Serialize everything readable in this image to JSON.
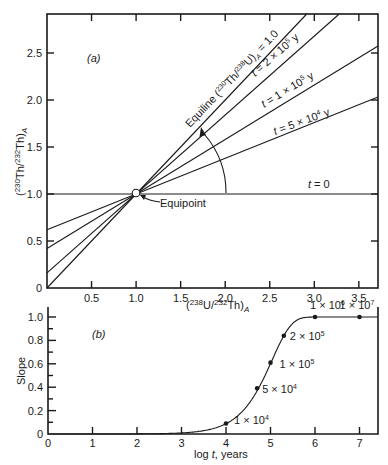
{
  "chart_data": [
    {
      "id": "a",
      "type": "line",
      "panel_label": "(a)",
      "xlabel": "(238U/232Th)A",
      "ylabel": "(230Th/232Th)A",
      "xlim": [
        0,
        3.71
      ],
      "ylim": [
        0,
        2.91
      ],
      "x_ticks": [
        0.5,
        1.0,
        1.5,
        2.0,
        2.5,
        3.0,
        3.5
      ],
      "x_tick_labels": [
        "0.5",
        "1.0",
        "1.5",
        "2.0",
        "2.5",
        "3.0",
        "3.5"
      ],
      "y_ticks": [
        0,
        0.5,
        1.0,
        1.5,
        2.0,
        2.5
      ],
      "y_tick_labels": [
        "0",
        "0.5",
        "1.0",
        "1.5",
        "2.0",
        "2.5"
      ],
      "equipoint": {
        "x": 1.0,
        "y": 1.0,
        "label": "Equipoint"
      },
      "series": [
        {
          "name": "t = 0",
          "slope": 0.0,
          "intercept": 1.0
        },
        {
          "name": "t = 5 × 10⁴ y",
          "slope": 0.38,
          "intercept": 0.62
        },
        {
          "name": "t = 1 × 10⁵ y",
          "slope": 0.58,
          "intercept": 0.42
        },
        {
          "name": "t = 2 × 10⁵ y",
          "slope": 0.84,
          "intercept": 0.16
        },
        {
          "name": "Equiline (230Th/238U)A = 1.0",
          "slope": 1.0,
          "intercept": 0.0
        }
      ],
      "annotations": {
        "equiline": "Equiline (230Th/238U)A = 1.0",
        "t2e5": "t = 2 × 10⁵ y",
        "t1e5": "t = 1 × 10⁵ y",
        "t5e4": "t = 5 × 10⁴ y",
        "t0": "t = 0",
        "arrow": "arc arrow from t = 0 line toward equiline, indicating rotation with time"
      }
    },
    {
      "id": "b",
      "type": "line",
      "panel_label": "(b)",
      "xlabel": "log t, years",
      "ylabel": "Slope",
      "xlim": [
        0,
        7.42
      ],
      "ylim": [
        0,
        1.085
      ],
      "x_ticks": [
        0,
        1,
        2,
        3,
        4,
        5,
        6,
        7
      ],
      "x_tick_labels": [
        "0",
        "1",
        "2",
        "3",
        "4",
        "5",
        "6",
        "7"
      ],
      "y_ticks": [
        0,
        0.2,
        0.4,
        0.6,
        0.8,
        1.0
      ],
      "y_tick_labels": [
        "0",
        "0.2",
        "0.4",
        "0.6",
        "0.8",
        "1.0"
      ],
      "y_minor_step": 0.1,
      "curve": {
        "name": "slope = 1 - exp(-λ230 t)",
        "x": [
          0,
          3.0,
          3.3,
          3.5,
          3.7,
          4.0,
          4.3,
          4.5,
          4.7,
          4.85,
          5.0,
          5.15,
          5.3,
          5.5,
          5.7,
          5.85,
          6.0,
          7.0,
          7.42
        ],
        "y": [
          0,
          0.0,
          0.009,
          0.014,
          0.022,
          0.087,
          0.17,
          0.26,
          0.37,
          0.46,
          0.6,
          0.72,
          0.84,
          0.94,
          0.98,
          0.995,
          1.0,
          1.0,
          1.0
        ]
      },
      "points": [
        {
          "x": 4.0,
          "y": 0.09,
          "label": "1 × 10⁴"
        },
        {
          "x": 4.7,
          "y": 0.39,
          "label": "5 × 10⁴"
        },
        {
          "x": 5.0,
          "y": 0.61,
          "label": "1 × 10⁵"
        },
        {
          "x": 5.3,
          "y": 0.84,
          "label": "2 × 10⁵"
        },
        {
          "x": 6.0,
          "y": 1.0,
          "label": "1 × 10⁶"
        },
        {
          "x": 7.0,
          "y": 1.0,
          "label": "1 × 10⁷"
        }
      ]
    }
  ],
  "labels": {
    "panel_a": "(a)",
    "panel_b": "(b)",
    "equipoint": "Equipoint",
    "t0": "t = 0",
    "slope_axis": "Slope",
    "logt_axis": "log t, years"
  }
}
